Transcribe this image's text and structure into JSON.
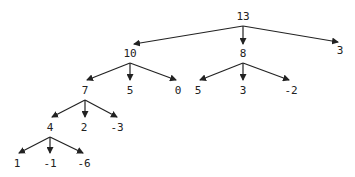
{
  "diagram": {
    "type": "tree",
    "nodes": [
      {
        "id": "n0",
        "label": "13",
        "x": 243,
        "y": 20
      },
      {
        "id": "n1",
        "label": "10",
        "x": 130,
        "y": 57
      },
      {
        "id": "n2",
        "label": "8",
        "x": 243,
        "y": 57
      },
      {
        "id": "n3",
        "label": "3",
        "x": 340,
        "y": 54
      },
      {
        "id": "n4",
        "label": "7",
        "x": 85,
        "y": 94
      },
      {
        "id": "n5",
        "label": "5",
        "x": 130,
        "y": 94
      },
      {
        "id": "n6",
        "label": "0",
        "x": 178,
        "y": 94
      },
      {
        "id": "n7",
        "label": "5",
        "x": 198,
        "y": 94
      },
      {
        "id": "n8",
        "label": "3",
        "x": 243,
        "y": 94
      },
      {
        "id": "n9",
        "label": "-2",
        "x": 291,
        "y": 94
      },
      {
        "id": "n10",
        "label": "4",
        "x": 50,
        "y": 131
      },
      {
        "id": "n11",
        "label": "2",
        "x": 84,
        "y": 131
      },
      {
        "id": "n12",
        "label": "-3",
        "x": 117,
        "y": 131
      },
      {
        "id": "n13",
        "label": "1",
        "x": 17,
        "y": 167
      },
      {
        "id": "n14",
        "label": "-1",
        "x": 50,
        "y": 167
      },
      {
        "id": "n15",
        "label": "-6",
        "x": 84,
        "y": 167
      }
    ],
    "edges": [
      {
        "from": "n0",
        "to": "n1",
        "x1": 243,
        "y1": 26,
        "x2": 134,
        "y2": 44
      },
      {
        "from": "n0",
        "to": "n2",
        "x1": 243,
        "y1": 26,
        "x2": 243,
        "y2": 44
      },
      {
        "from": "n0",
        "to": "n3",
        "x1": 243,
        "y1": 26,
        "x2": 338,
        "y2": 42
      },
      {
        "from": "n1",
        "to": "n4",
        "x1": 130,
        "y1": 63,
        "x2": 87,
        "y2": 80
      },
      {
        "from": "n1",
        "to": "n5",
        "x1": 130,
        "y1": 63,
        "x2": 130,
        "y2": 80
      },
      {
        "from": "n1",
        "to": "n6",
        "x1": 130,
        "y1": 63,
        "x2": 176,
        "y2": 80
      },
      {
        "from": "n2",
        "to": "n7",
        "x1": 243,
        "y1": 63,
        "x2": 200,
        "y2": 80
      },
      {
        "from": "n2",
        "to": "n8",
        "x1": 243,
        "y1": 63,
        "x2": 243,
        "y2": 80
      },
      {
        "from": "n2",
        "to": "n9",
        "x1": 243,
        "y1": 63,
        "x2": 289,
        "y2": 80
      },
      {
        "from": "n4",
        "to": "n10",
        "x1": 85,
        "y1": 100,
        "x2": 52,
        "y2": 117
      },
      {
        "from": "n4",
        "to": "n11",
        "x1": 85,
        "y1": 100,
        "x2": 85,
        "y2": 117
      },
      {
        "from": "n4",
        "to": "n12",
        "x1": 85,
        "y1": 100,
        "x2": 117,
        "y2": 117
      },
      {
        "from": "n10",
        "to": "n13",
        "x1": 50,
        "y1": 137,
        "x2": 19,
        "y2": 153
      },
      {
        "from": "n10",
        "to": "n14",
        "x1": 50,
        "y1": 137,
        "x2": 50,
        "y2": 153
      },
      {
        "from": "n10",
        "to": "n15",
        "x1": 50,
        "y1": 137,
        "x2": 83,
        "y2": 153
      }
    ]
  }
}
